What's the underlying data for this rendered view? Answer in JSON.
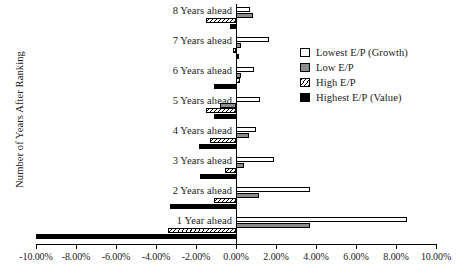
{
  "chart_data": {
    "type": "bar",
    "orientation": "horizontal",
    "title": "",
    "xlabel": "",
    "ylabel": "Number of Years After Ranking",
    "xlim": [
      -0.1,
      0.1
    ],
    "xtick_labels": [
      "-10.00%",
      "-8.00%",
      "-6.00%",
      "-4.00%",
      "-2.00%",
      "0.00%",
      "2.00%",
      "4.00%",
      "6.00%",
      "8.00%",
      "10.00%"
    ],
    "xtick_values": [
      -0.1,
      -0.08,
      -0.06,
      -0.04,
      -0.02,
      0.0,
      0.02,
      0.04,
      0.06,
      0.08,
      0.1
    ],
    "grid": false,
    "legend_position": "right",
    "categories": [
      "1 Year ahead",
      "2 Years ahead",
      "3 Years ahead",
      "4 Years ahead",
      "5 Years ahead",
      "6 Years ahead",
      "7 Years ahead",
      "8 Years ahead"
    ],
    "series": [
      {
        "name": "Lowest E/P (Growth)",
        "swatch": "white-outline",
        "color": "#ffffff",
        "values": [
          0.0855,
          0.037,
          0.019,
          0.01,
          0.012,
          0.009,
          0.0165,
          0.007
        ]
      },
      {
        "name": "Low E/P",
        "swatch": "gray",
        "color": "#8c8c8c",
        "values": [
          0.037,
          0.0115,
          0.004,
          0.0065,
          -0.008,
          0.0025,
          0.0025,
          0.0085
        ]
      },
      {
        "name": "High E/P",
        "swatch": "hatched",
        "color": "#ffffff",
        "values": [
          -0.034,
          -0.011,
          -0.0055,
          -0.013,
          -0.015,
          0.002,
          -0.0015,
          -0.015
        ]
      },
      {
        "name": "Highest E/P (Value)",
        "swatch": "black",
        "color": "#000000",
        "values": [
          -0.1,
          -0.033,
          -0.018,
          -0.0185,
          -0.011,
          -0.011,
          0.0015,
          -0.003
        ]
      }
    ]
  },
  "legend": {
    "items": [
      {
        "label": "Lowest E/P (Growth)"
      },
      {
        "label": "Low E/P"
      },
      {
        "label": "High E/P"
      },
      {
        "label": "Highest E/P (Value)"
      }
    ]
  }
}
